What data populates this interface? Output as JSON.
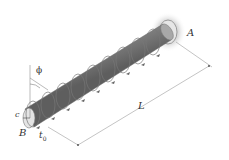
{
  "diagram": {
    "labels": {
      "A": "A",
      "B": "B",
      "L": "L",
      "c": "c",
      "phi": "ϕ",
      "t0": "t",
      "t0_sub": "0"
    },
    "colors": {
      "shaft_dark": "#6e6e6e",
      "shaft_light": "#bdbdbd",
      "wall_glow": "#cfcfcf",
      "lines": "#555555",
      "background": "#ffffff"
    },
    "elements": [
      "fixed-support-A",
      "shaft",
      "distributed-torque-helix",
      "twist-angle-phi",
      "radius-c",
      "end-B",
      "length-dimension-L"
    ]
  }
}
